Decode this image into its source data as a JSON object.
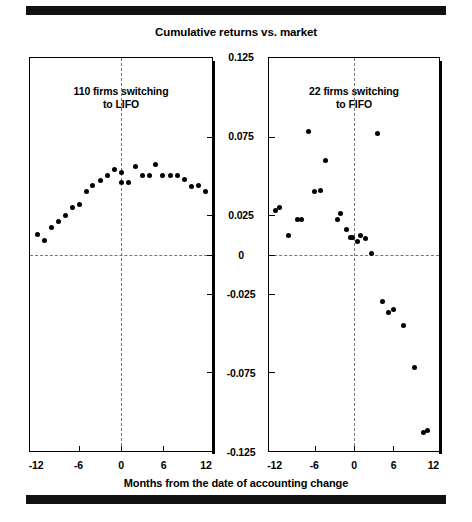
{
  "figure": {
    "title": "Cumulative returns vs. market",
    "xlabel": "Months from the date of accounting change",
    "rule_color": "#111111",
    "point_color": "#000000",
    "guide_color": "#777777"
  },
  "chart_data": {
    "type": "scatter",
    "title": "Cumulative returns vs. market",
    "xlabel": "Months from the date of accounting change",
    "ylabel": "",
    "xlim": [
      -13,
      13
    ],
    "ylim": [
      -0.125,
      0.125
    ],
    "yticks": [
      0.125,
      0.075,
      0.025,
      0,
      -0.025,
      -0.075,
      -0.125
    ],
    "ytick_labels": [
      "0.125",
      "0.075",
      "0.025",
      "0",
      "-0.025",
      "-0.075",
      "-0.125"
    ],
    "xticks": [
      -12,
      -6,
      0,
      6,
      12
    ],
    "xtick_labels": [
      "-12",
      "-6",
      "0",
      "6",
      "12"
    ],
    "grid": false,
    "legend": "none",
    "reference_lines": {
      "horizontal": 0,
      "vertical": 0
    },
    "panels": [
      {
        "name": "lifo",
        "annotation": "110 firms switching\nto LIFO",
        "annotation_line1": "110 firms switching",
        "annotation_line2": "to LIFO",
        "series": [
          {
            "name": "110 firms switching to LIFO",
            "x": [
              -12,
              -11,
              -10,
              -9,
              -8,
              -7,
              -6,
              -5,
              -4,
              -3,
              -2,
              -1,
              0,
              0,
              1,
              2,
              3,
              4,
              5,
              6,
              7,
              8,
              9,
              10,
              11,
              12
            ],
            "y": [
              0.013,
              0.009,
              0.017,
              0.021,
              0.025,
              0.03,
              0.032,
              0.04,
              0.044,
              0.047,
              0.05,
              0.054,
              0.052,
              0.046,
              0.046,
              0.056,
              0.05,
              0.05,
              0.057,
              0.05,
              0.05,
              0.05,
              0.048,
              0.043,
              0.044,
              0.04
            ]
          }
        ]
      },
      {
        "name": "fifo",
        "annotation": "22 firms switching\nto FIFO",
        "annotation_line1": "22 firms switching",
        "annotation_line2": "to FIFO",
        "series": [
          {
            "name": "22 firms switching to FIFO",
            "x": [
              -12,
              -11.4,
              -10,
              -8.6,
              -8,
              -7,
              -6,
              -5.2,
              -4.3,
              -2.6,
              -2,
              -1.2,
              -0.6,
              -0.3,
              0.6,
              1.0,
              1.8,
              2.6,
              3.6,
              4.4,
              5.2,
              6.0,
              7.6,
              9.2,
              10.6,
              11.3
            ],
            "y": [
              0.028,
              0.03,
              0.012,
              0.022,
              0.022,
              0.078,
              0.04,
              0.041,
              0.06,
              0.022,
              0.026,
              0.016,
              0.011,
              0.011,
              0.008,
              0.012,
              0.01,
              0.0005,
              0.077,
              -0.03,
              -0.037,
              -0.035,
              -0.045,
              -0.072,
              -0.113,
              -0.112
            ]
          }
        ]
      }
    ]
  }
}
